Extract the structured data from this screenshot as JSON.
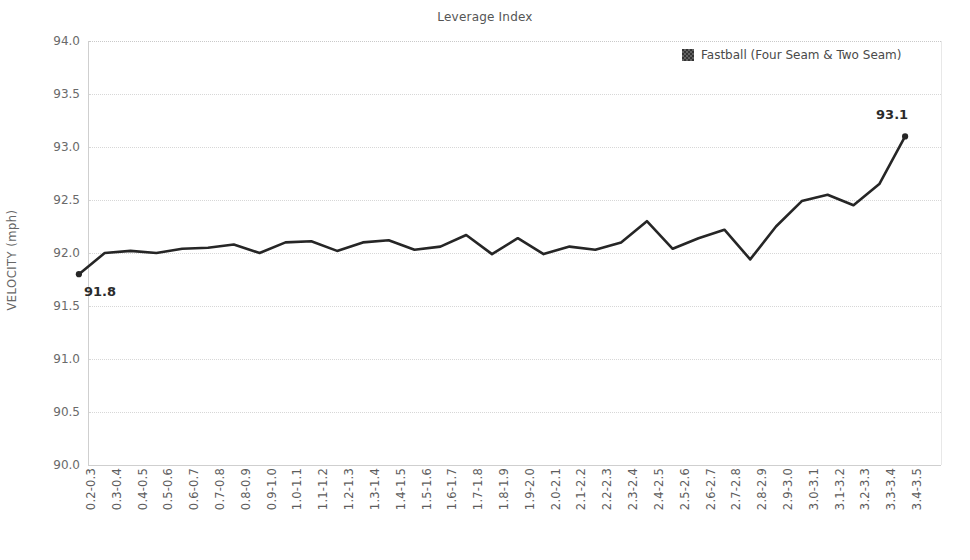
{
  "chart_data": {
    "type": "line",
    "title": "Leverage Index",
    "xlabel": "",
    "ylabel": "VELOCITY (mph)",
    "ylim": [
      90.0,
      94.0
    ],
    "ytick_step": 0.5,
    "yticks": [
      "94.0",
      "93.5",
      "93.0",
      "92.5",
      "92.0",
      "91.5",
      "91.0",
      "90.5",
      "90.0"
    ],
    "grid": true,
    "legend_position": "top-right",
    "series_color": "#262626",
    "categories": [
      "0.2-0.3",
      "0.3-0.4",
      "0.4-0.5",
      "0.5-0.6",
      "0.6-0.7",
      "0.7-0.8",
      "0.8-0.9",
      "0.9-1.0",
      "1.0-1.1",
      "1.1-1.2",
      "1.2-1.3",
      "1.3-1.4",
      "1.4-1.5",
      "1.5-1.6",
      "1.6-1.7",
      "1.7-1.8",
      "1.8-1.9",
      "1.9-2.0",
      "2.0-2.1",
      "2.1-2.2",
      "2.2-2.3",
      "2.3-2.4",
      "2.4-2.5",
      "2.5-2.6",
      "2.6-2.7",
      "2.7-2.8",
      "2.8-2.9",
      "2.9-3.0",
      "3.0-3.1",
      "3.1-3.2",
      "3.2-3.3",
      "3.3-3.4",
      "3.4-3.5"
    ],
    "series": [
      {
        "name": "Fastball (Four Seam & Two Seam)",
        "values": [
          91.8,
          92.0,
          92.02,
          92.0,
          92.04,
          92.05,
          92.08,
          92.0,
          92.1,
          92.11,
          92.02,
          92.1,
          92.12,
          92.03,
          92.06,
          92.17,
          91.99,
          92.14,
          91.99,
          92.06,
          92.03,
          92.1,
          92.3,
          92.04,
          92.14,
          92.22,
          91.94,
          92.25,
          92.49,
          92.55,
          92.45,
          92.65,
          93.1
        ]
      }
    ],
    "point_labels": [
      {
        "index": 0,
        "text": "91.8"
      },
      {
        "index": 32,
        "text": "93.1"
      }
    ]
  },
  "legend": {
    "entries": [
      {
        "label": "Fastball (Four Seam & Two Seam)",
        "color": "#333333"
      }
    ]
  }
}
